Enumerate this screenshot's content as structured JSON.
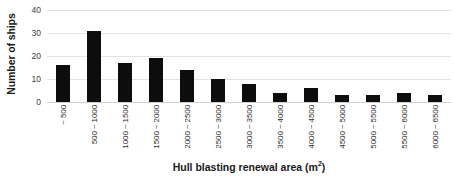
{
  "chart_data": {
    "type": "bar",
    "title": "",
    "xlabel": "Hull blasting renewal area (m2)",
    "xlabel_base": "Hull blasting renewal area (m",
    "xlabel_sup": "2",
    "xlabel_tail": ")",
    "ylabel": "Number of ships",
    "categories": [
      "~ 500",
      "500 ~ 1000",
      "1000 ~ 1500",
      "1500 ~ 2000",
      "2000 ~ 2500",
      "2500 ~ 3000",
      "3000 ~ 3500",
      "3500 ~ 4000",
      "4000 ~ 4500",
      "4500 ~ 5000",
      "5000 ~ 5500",
      "5500 ~ 6000",
      "6000 ~ 6500"
    ],
    "values": [
      16,
      31,
      17,
      19,
      14,
      10,
      8,
      4,
      6,
      3,
      3,
      4,
      3
    ],
    "ylim": [
      0,
      40
    ],
    "yticks": [
      0,
      10,
      20,
      30,
      40
    ],
    "ytick_labels": [
      "0",
      "10",
      "20",
      "30",
      "40"
    ],
    "grid": true,
    "grid_axis": "y",
    "legend": false,
    "legend_position": "none",
    "bar_color": "#0d0d0d",
    "gridline_color": "#e3e3e3",
    "background_color": "#ffffff",
    "text_color": "#1a1a1a",
    "xtick_rotation": 90
  }
}
